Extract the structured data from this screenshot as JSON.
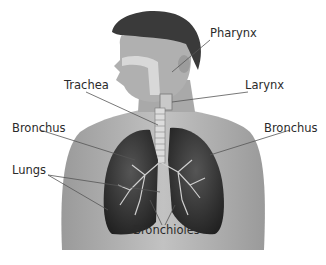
{
  "figure": {
    "colors": {
      "background": "#ffffff",
      "skin": "#b5b5b5",
      "skin_shade": "#8f8f8f",
      "hair": "#3a3a3a",
      "lung": "#2c2c2c",
      "airway": "#d8d8d8",
      "leader_line": "#555555",
      "label_text": "#2b2b2b"
    },
    "labels": [
      {
        "id": "pharynx",
        "text": "Pharynx",
        "x": 210,
        "y": 28
      },
      {
        "id": "trachea",
        "text": "Trachea",
        "x": 64,
        "y": 80
      },
      {
        "id": "larynx",
        "text": "Larynx",
        "x": 245,
        "y": 80
      },
      {
        "id": "bronchus-left",
        "text": "Bronchus",
        "x": 12,
        "y": 123
      },
      {
        "id": "bronchus-right",
        "text": "Bronchus",
        "x": 264,
        "y": 123
      },
      {
        "id": "lungs",
        "text": "Lungs",
        "x": 12,
        "y": 165
      },
      {
        "id": "bronchioles",
        "text": "Bronchioles",
        "x": 133,
        "y": 225
      }
    ]
  }
}
